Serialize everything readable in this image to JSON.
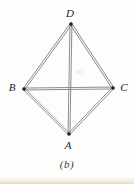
{
  "figure": {
    "caption": "(b)",
    "colors": {
      "edge": "#868686",
      "vertex_dot": "#1c1c1c",
      "label": "#1f1f1f",
      "background": "#fdfdfc",
      "page_edge_tint": "#e0cfa8"
    },
    "style": {
      "double_line_offset": 0.95,
      "stroke_width": 0.95,
      "dot_radius": 1.7,
      "label_font_size": 11
    },
    "vertices": [
      {
        "id": "D",
        "label": "D",
        "x": 71,
        "y": 24,
        "label_dx": -1,
        "label_dy": -7
      },
      {
        "id": "B",
        "label": "B",
        "x": 24,
        "y": 89,
        "label_dx": -12,
        "label_dy": 2
      },
      {
        "id": "C",
        "label": "C",
        "x": 113,
        "y": 88,
        "label_dx": 11,
        "label_dy": 3
      },
      {
        "id": "A",
        "label": "A",
        "x": 69,
        "y": 134,
        "label_dx": -1,
        "label_dy": 15
      }
    ],
    "edges": [
      {
        "from": "D",
        "to": "B"
      },
      {
        "from": "D",
        "to": "C"
      },
      {
        "from": "B",
        "to": "A"
      },
      {
        "from": "C",
        "to": "A"
      },
      {
        "from": "B",
        "to": "C"
      },
      {
        "from": "D",
        "to": "A"
      }
    ]
  }
}
